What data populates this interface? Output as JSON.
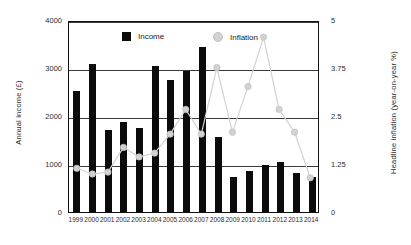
{
  "chart_data": {
    "type": "bar",
    "title": "",
    "categories": [
      "1999",
      "2000",
      "2001",
      "2002",
      "2003",
      "2004",
      "2005",
      "2006",
      "2007",
      "2008",
      "2009",
      "2010",
      "2011",
      "2012",
      "2013",
      "2014"
    ],
    "xlabel": "",
    "ylabel": "Annual income (£)",
    "y2label": "Headline inflation (year-on-year %)",
    "ylim": [
      0,
      4000
    ],
    "y2lim": [
      0,
      5
    ],
    "yticks": [
      "0",
      "1000",
      "2000",
      "3000",
      "4000"
    ],
    "y2ticks": [
      "0",
      "1.25",
      "2.5",
      "3.75",
      "5"
    ],
    "grid": true,
    "legend_position": "top-center",
    "series": [
      {
        "name": "Income",
        "type": "bar",
        "axis": "left",
        "color": "#0b0b0b",
        "values": [
          2530,
          3090,
          1700,
          1870,
          1750,
          3040,
          2740,
          2930,
          3430,
          1570,
          720,
          850,
          975,
          1050,
          810,
          720
        ]
      },
      {
        "name": "Inflation",
        "type": "line",
        "axis": "right",
        "color": "#d2d2d2",
        "values": [
          1.15,
          1.0,
          1.05,
          1.7,
          1.45,
          1.55,
          2.05,
          2.7,
          2.05,
          3.8,
          2.1,
          3.3,
          4.6,
          2.7,
          2.1,
          0.9
        ]
      }
    ],
    "legend": [
      {
        "label": "Income",
        "marker": "square",
        "color": "#0b0b0b"
      },
      {
        "label": "Inflation",
        "marker": "circle",
        "color": "#d2d2d2"
      }
    ]
  }
}
